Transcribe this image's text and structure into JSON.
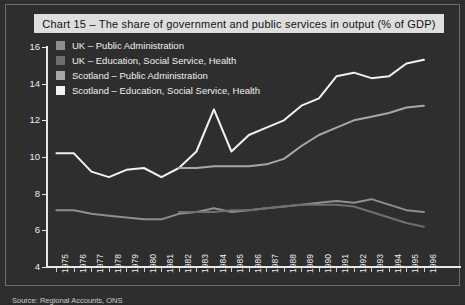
{
  "title": "Chart 15 – The share of government and public services in output (% of GDP)",
  "source": "Source: Regional Accounts, ONS",
  "colors": {
    "background": "#2e2e2e",
    "frame_border": "#6d6d6d",
    "title_banner": "#dedede",
    "axis": "#e8e8e8",
    "series_uk_public_admin": "#8f8f8f",
    "series_uk_education": "#6f6f6f",
    "series_scotland_public_admin": "#a8a8a8",
    "series_scotland_education": "#f2f2f2"
  },
  "legend": {
    "position": "top-left-inside",
    "items": [
      {
        "label": "UK – Public Administration",
        "swatch": "#8f8f8f"
      },
      {
        "label": "UK – Education, Social Service, Health",
        "swatch": "#6f6f6f"
      },
      {
        "label": "Scotland – Public Administration",
        "swatch": "#a8a8a8"
      },
      {
        "label": "Scotland – Education, Social Service, Health",
        "swatch": "#f2f2f2"
      }
    ]
  },
  "chart_data": {
    "type": "line",
    "title": "Chart 15 – The share of government and public services in output (% of GDP)",
    "xlabel": "",
    "ylabel": "",
    "grid": false,
    "legend_position": "top-left-inside",
    "ylim": [
      4,
      16
    ],
    "yticks": [
      4,
      6,
      8,
      10,
      12,
      14,
      16
    ],
    "categories": [
      "1975",
      "1976",
      "1977",
      "1978",
      "1979",
      "1980",
      "1981",
      "1982",
      "1983",
      "1984",
      "1985",
      "1986",
      "1987",
      "1988",
      "1989",
      "1990",
      "1991",
      "1992",
      "1993",
      "1994",
      "1995",
      "1996"
    ],
    "series": [
      {
        "name": "Scotland – Education, Social Service, Health",
        "color": "#f2f2f2",
        "values": [
          10.2,
          10.2,
          9.2,
          8.9,
          9.3,
          9.4,
          8.9,
          9.4,
          10.3,
          12.6,
          10.3,
          11.2,
          11.6,
          12.0,
          12.8,
          13.2,
          14.4,
          14.6,
          14.3,
          14.4,
          15.1,
          15.3
        ]
      },
      {
        "name": "Scotland – Public Administration",
        "color": "#a8a8a8",
        "values": [
          null,
          null,
          null,
          null,
          null,
          null,
          null,
          9.4,
          9.4,
          9.5,
          9.5,
          9.5,
          9.6,
          9.9,
          10.6,
          11.2,
          11.6,
          12.0,
          12.2,
          12.4,
          12.7,
          12.8
        ]
      },
      {
        "name": "UK – Public Administration",
        "color": "#8f8f8f",
        "values": [
          7.1,
          7.1,
          6.9,
          6.8,
          6.7,
          6.6,
          6.6,
          6.9,
          7.0,
          7.2,
          7.0,
          7.1,
          7.2,
          7.3,
          7.4,
          7.5,
          7.6,
          7.5,
          7.7,
          7.4,
          7.1,
          7.0
        ]
      },
      {
        "name": "UK – Education, Social Service, Health",
        "color": "#6f6f6f",
        "values": [
          null,
          null,
          null,
          null,
          null,
          null,
          null,
          7.0,
          7.0,
          7.0,
          7.1,
          7.1,
          7.2,
          7.3,
          7.4,
          7.4,
          7.4,
          7.3,
          7.0,
          6.7,
          6.4,
          6.2
        ]
      }
    ]
  }
}
